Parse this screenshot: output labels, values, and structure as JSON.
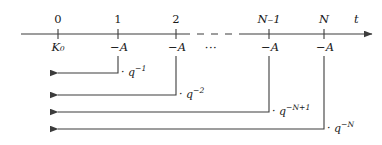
{
  "diagram": {
    "kind": "cash-flow-timeline",
    "axis": {
      "variable_label": "t",
      "line_color": "#3c3c3c",
      "start_x": 21,
      "end_x": 372,
      "y": 34,
      "dash_gap": {
        "from_x": 183,
        "to_x": 246
      }
    },
    "ticks": [
      {
        "id": "t0",
        "number": "0",
        "italic": false,
        "x": 58,
        "amount": "K₀",
        "amount_is_principal": true
      },
      {
        "id": "t1",
        "number": "1",
        "italic": false,
        "x": 118,
        "amount": "−A",
        "amount_is_principal": false
      },
      {
        "id": "t2",
        "number": "2",
        "italic": false,
        "x": 176,
        "amount": "−A",
        "amount_is_principal": false
      },
      {
        "id": "tNm1",
        "number": "N–1",
        "italic": true,
        "x": 269,
        "amount": "−A",
        "amount_is_principal": false
      },
      {
        "id": "tN",
        "number": "N",
        "italic": true,
        "x": 324,
        "amount": "−A",
        "amount_is_principal": false
      }
    ],
    "ellipsis": {
      "glyph": "···",
      "x": 211,
      "y": 50
    },
    "discount_arrows": [
      {
        "id": "arrow-q-1",
        "from_x": 118,
        "to_x": 58,
        "row_y": 73,
        "drop_from_y": 56,
        "factor_base": "· q",
        "factor_exponent": "−1",
        "label_x": 121,
        "label_y": 68
      },
      {
        "id": "arrow-q-2",
        "from_x": 176,
        "to_x": 58,
        "row_y": 95,
        "drop_from_y": 56,
        "factor_base": "· q",
        "factor_exponent": "−2",
        "label_x": 179,
        "label_y": 90
      },
      {
        "id": "arrow-q-N-plus-1",
        "from_x": 269,
        "to_x": 58,
        "row_y": 112,
        "drop_from_y": 56,
        "factor_base": "· q",
        "factor_exponent": "−N+1",
        "label_x": 272,
        "label_y": 107
      },
      {
        "id": "arrow-q-N",
        "from_x": 324,
        "to_x": 58,
        "row_y": 129,
        "drop_from_y": 56,
        "factor_base": "· q",
        "factor_exponent": "−N",
        "label_x": 327,
        "label_y": 124
      }
    ],
    "colors": {
      "ink": "#1a1a1a",
      "line": "#3c3c3c",
      "background": "#ffffff"
    }
  }
}
